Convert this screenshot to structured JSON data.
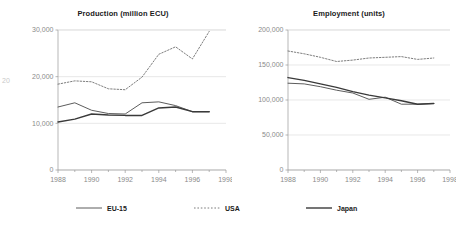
{
  "figure": {
    "edge_artifact_label": "20"
  },
  "legend": {
    "position": "bottom",
    "items": [
      {
        "label": "EU-15",
        "style": "solid-thin",
        "color": "#4a4a4a",
        "name": "eu"
      },
      {
        "label": "USA",
        "style": "dotted",
        "color": "#6e6e6e",
        "name": "usa"
      },
      {
        "label": "Japan",
        "style": "solid-thick",
        "color": "#3a3a3a",
        "name": "japan"
      }
    ]
  },
  "chart_data": [
    {
      "type": "line",
      "title": "Production (million ECU)",
      "xlabel": "",
      "ylabel": "",
      "grid": true,
      "legend": "bottom",
      "x": [
        1988,
        1989,
        1990,
        1991,
        1992,
        1993,
        1994,
        1995,
        1996,
        1997
      ],
      "xlim": [
        1988,
        1998
      ],
      "xticks": [
        1988,
        1990,
        1992,
        1994,
        1996,
        1998
      ],
      "xticklabels": [
        "1988",
        "1990",
        "1992",
        "1994",
        "1996",
        "1998"
      ],
      "ylim": [
        0,
        30000
      ],
      "yticks": [
        0,
        10000,
        20000,
        30000
      ],
      "yticklabels": [
        "0",
        "10,000",
        "20,000",
        "30,000"
      ],
      "series": [
        {
          "name": "EU-15",
          "values": [
            13500,
            14400,
            12800,
            12100,
            12000,
            14400,
            14600,
            13800,
            12500,
            12500
          ]
        },
        {
          "name": "USA",
          "values": [
            18400,
            19100,
            18900,
            17400,
            17200,
            19900,
            24800,
            26400,
            23800,
            29700
          ]
        },
        {
          "name": "Japan",
          "values": [
            10300,
            10900,
            12000,
            11800,
            11700,
            11700,
            13300,
            13500,
            12500,
            12500
          ]
        }
      ]
    },
    {
      "type": "line",
      "title": "Employment (units)",
      "xlabel": "",
      "ylabel": "",
      "grid": true,
      "legend": "bottom",
      "x": [
        1988,
        1989,
        1990,
        1991,
        1992,
        1993,
        1994,
        1995,
        1996,
        1997
      ],
      "xlim": [
        1988,
        1998
      ],
      "xticks": [
        1988,
        1990,
        1992,
        1994,
        1996,
        1998
      ],
      "xticklabels": [
        "1988",
        "1990",
        "1992",
        "1994",
        "1996",
        "1998"
      ],
      "ylim": [
        0,
        200000
      ],
      "yticks": [
        0,
        50000,
        100000,
        150000,
        200000
      ],
      "yticklabels": [
        "0",
        "50,000",
        "100,000",
        "150,000",
        "200,000"
      ],
      "series": [
        {
          "name": "EU-15",
          "values": [
            124000,
            123000,
            119000,
            114000,
            110000,
            101000,
            104000,
            94000,
            94000,
            95000
          ]
        },
        {
          "name": "USA",
          "values": [
            170000,
            166000,
            161000,
            155000,
            157000,
            160000,
            161000,
            162000,
            158000,
            160000
          ]
        },
        {
          "name": "Japan",
          "values": [
            132000,
            128000,
            123000,
            118000,
            112000,
            107000,
            103000,
            99000,
            94000,
            95000
          ]
        }
      ]
    }
  ]
}
